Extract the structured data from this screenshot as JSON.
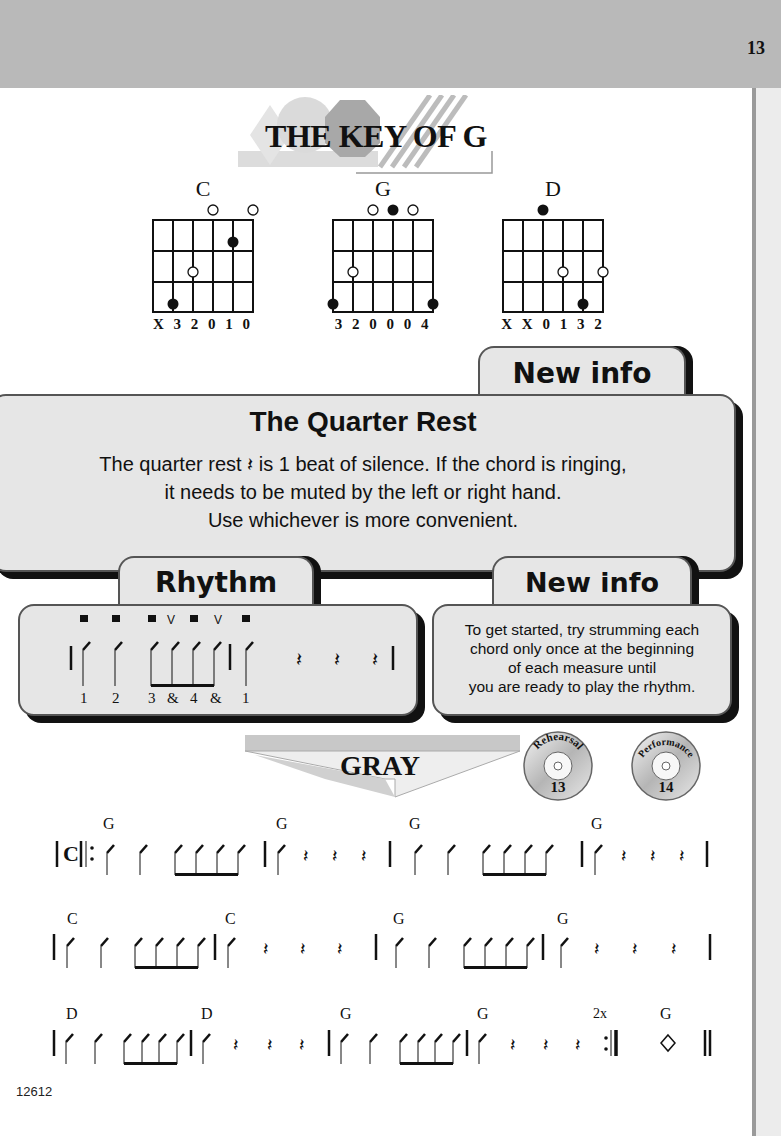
{
  "page": {
    "number": "13",
    "footer_code": "12612"
  },
  "header": {
    "title": "THE KEY OF G"
  },
  "chords": [
    {
      "name": "C",
      "fingering": "X 3 2 0 1 0"
    },
    {
      "name": "G",
      "fingering": "3 2 0 0 0 4"
    },
    {
      "name": "D",
      "fingering": "X X 0 1 3 2"
    }
  ],
  "quarter_rest_box": {
    "tab_label": "New info",
    "title": "The Quarter Rest",
    "lines": [
      "The quarter rest 𝄽 is 1 beat of silence.  If the chord is ringing,",
      "it needs to be muted by the left or right hand.",
      "Use whichever is more convenient."
    ]
  },
  "rhythm_box": {
    "tab_label": "Rhythm",
    "counts": [
      "1",
      "2",
      "3",
      "&",
      "4",
      "&",
      "1"
    ]
  },
  "tip_box": {
    "tab_label": "New info",
    "lines": [
      "To get started, try strumming each",
      "chord only once at the beginning",
      "of each measure until",
      "you are ready to play the rhythm."
    ]
  },
  "song": {
    "title": "GRAY",
    "tracks": [
      {
        "label": "Rehearsal",
        "number": "13"
      },
      {
        "label": "Performance",
        "number": "14"
      }
    ],
    "time_signature": "C",
    "repeat_label": "2x",
    "systems": [
      {
        "chords": [
          "G",
          "G",
          "G",
          "G"
        ]
      },
      {
        "chords": [
          "C",
          "C",
          "G",
          "G"
        ]
      },
      {
        "chords": [
          "D",
          "D",
          "G",
          "G",
          "G"
        ]
      }
    ]
  },
  "colors": {
    "band": "#b9b9b9",
    "box_fill": "#e6e6e6",
    "shadow": "#111111"
  }
}
